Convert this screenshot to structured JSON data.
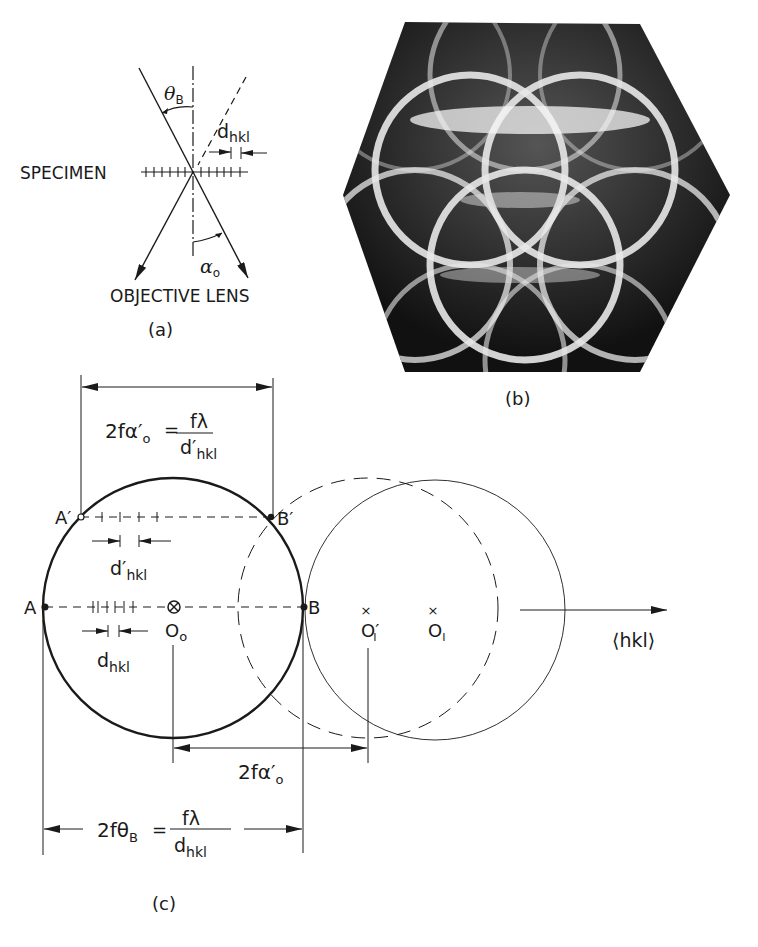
{
  "panel_a": {
    "caption": "(a)",
    "specimen_label": "SPECIMEN",
    "objective_label": "OBJECTIVE LENS",
    "theta_label": "θ",
    "theta_sub": "B",
    "alpha_label": "α",
    "alpha_sub": "o",
    "d_label": "d",
    "d_sub": "hkl"
  },
  "panel_b": {
    "caption": "(b)",
    "description": "Hexagonal diffraction pattern photograph showing intersecting bright circular rings on dark background"
  },
  "panel_c": {
    "caption": "(c)",
    "top_formula": {
      "lhs": "2fα′",
      "lhs_sub": "o",
      "eq": "=",
      "num": "fλ",
      "den": "d′",
      "den_sub": "hkl"
    },
    "bottom_formula": {
      "lhs": "2fθ",
      "lhs_sub": "B",
      "eq": "=",
      "num": "fλ",
      "den": "d",
      "den_sub": "hkl"
    },
    "mid_dimension": {
      "text": "2fα′",
      "sub": "o"
    },
    "points": {
      "A": "A",
      "A_prime": "A′",
      "B": "B",
      "B_prime": "B′",
      "O0": "O",
      "O0_sub": "o",
      "O1": "O",
      "O1_sub": "I",
      "O1_prime": "O′",
      "O1_prime_sub": "I"
    },
    "d_prime_label": "d′",
    "d_prime_sub": "hkl",
    "d_label": "d",
    "d_sub": "hkl",
    "axis_label": "⟨hkl⟩"
  }
}
